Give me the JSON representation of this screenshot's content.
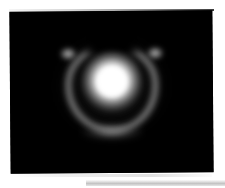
{
  "viewer": {
    "name": "astronomical-image-viewer",
    "background_color": "#ffffff",
    "panel": {
      "name": "image-display-panel",
      "background_color": "#000000",
      "border_color": "#d8d8d8",
      "x": 10,
      "y": 11,
      "width": 203,
      "height": 162,
      "rotation_deg": -0.45
    },
    "bottom_bar": {
      "name": "status-bar",
      "color": "#c4c4c4",
      "x": 86,
      "y": 180,
      "width": 139,
      "height": 6
    }
  },
  "scene": {
    "description": "bright central source surrounded by an incomplete ring open at the top",
    "colormap": "grayscale",
    "features": [
      {
        "name": "central-source",
        "shape": "gaussian-blob",
        "center_x": 113,
        "center_y": 84,
        "radius": 31,
        "peak_color": "#ffffff",
        "peak_value": 255
      },
      {
        "name": "partial-ring",
        "shape": "horseshoe-arc",
        "center_x": 113,
        "center_y": 89,
        "width": 92,
        "height": 88,
        "thickness": 5,
        "opening": "top",
        "opening_angle_deg": 70,
        "color": "#969696",
        "peak_value": 150
      },
      {
        "name": "arc-tip-left",
        "shape": "knot",
        "center_x": 76,
        "center_y": 57,
        "color": "#d7d7d7",
        "peak_value": 215
      },
      {
        "name": "arc-tip-right",
        "shape": "knot",
        "center_x": 151,
        "center_y": 57,
        "color": "#d7d7d7",
        "peak_value": 215
      },
      {
        "name": "outer-halo",
        "shape": "diffuse-glow",
        "center_x": 113,
        "center_y": 85,
        "color": "#282828",
        "peak_value": 40
      }
    ]
  }
}
